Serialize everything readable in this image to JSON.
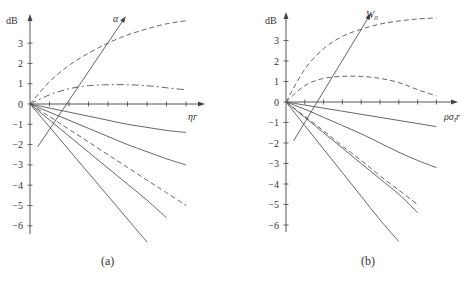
{
  "chart_data": [
    {
      "type": "line",
      "panel_label": "(a)",
      "ylabel": "dB",
      "xlabel": "ηr",
      "arrow_label": "α",
      "yticks": [
        3,
        2,
        1,
        0,
        -1,
        -2,
        -3,
        -4,
        -5,
        -6
      ],
      "ylim": [
        -7,
        4.3
      ],
      "grid": false,
      "x": [
        0,
        1,
        2,
        3,
        4,
        5,
        6,
        7,
        8
      ],
      "series": [
        {
          "name": "upper dashed",
          "style": "dashed",
          "values": [
            0,
            1.1,
            1.9,
            2.5,
            3.0,
            3.4,
            3.7,
            3.95,
            4.1
          ]
        },
        {
          "name": "dash-dot",
          "style": "dashdot",
          "values": [
            0,
            0.45,
            0.75,
            0.9,
            0.95,
            0.95,
            0.9,
            0.8,
            0.7
          ]
        },
        {
          "name": "solid 1",
          "style": "solid",
          "values": [
            0,
            -0.2,
            -0.4,
            -0.6,
            -0.8,
            -1.0,
            -1.15,
            -1.3,
            -1.4
          ]
        },
        {
          "name": "solid 2",
          "style": "solid",
          "values": [
            0,
            -0.4,
            -0.8,
            -1.2,
            -1.6,
            -2.0,
            -2.35,
            -2.7,
            -3.0
          ]
        },
        {
          "name": "lower dashed",
          "style": "dashed",
          "values": [
            0,
            -0.62,
            -1.25,
            -1.87,
            -2.5,
            -3.12,
            -3.75,
            -4.37,
            -5.0
          ]
        },
        {
          "name": "solid 3",
          "style": "solid",
          "values": [
            0,
            -0.79,
            -1.58,
            -2.37,
            -3.16,
            -3.95,
            -4.74,
            -5.6
          ]
        },
        {
          "name": "solid 4",
          "style": "solid",
          "values": [
            0,
            -1.13,
            -2.27,
            -3.4,
            -4.53,
            -5.67,
            -6.8
          ]
        }
      ],
      "arrow": {
        "from": [
          0.4,
          -2.1
        ],
        "to": [
          4.9,
          4.3
        ],
        "label": "α"
      }
    },
    {
      "type": "line",
      "panel_label": "(b)",
      "ylabel": "dB",
      "xlabel": "ρσIr",
      "arrow_label": "W0",
      "yticks": [
        3,
        2,
        1,
        0,
        -1,
        -2,
        -3,
        -4,
        -5,
        -6
      ],
      "ylim": [
        -7,
        4.3
      ],
      "grid": false,
      "x": [
        0,
        1,
        2,
        3,
        4,
        5,
        6,
        7,
        8
      ],
      "series": [
        {
          "name": "upper dashed",
          "style": "dashed",
          "values": [
            0,
            1.6,
            2.6,
            3.2,
            3.55,
            3.8,
            3.95,
            4.05,
            4.1
          ]
        },
        {
          "name": "middle dashed",
          "style": "dashed",
          "values": [
            0,
            0.8,
            1.15,
            1.25,
            1.25,
            1.15,
            0.95,
            0.6,
            0.3
          ]
        },
        {
          "name": "solid 1",
          "style": "solid",
          "values": [
            0,
            -0.15,
            -0.3,
            -0.45,
            -0.6,
            -0.75,
            -0.9,
            -1.05,
            -1.2
          ]
        },
        {
          "name": "solid 2",
          "style": "solid",
          "values": [
            0,
            -0.35,
            -0.75,
            -1.15,
            -1.55,
            -2.0,
            -2.45,
            -2.85,
            -3.2
          ]
        },
        {
          "name": "lower dashed",
          "style": "dashed",
          "values": [
            0,
            -0.7,
            -1.4,
            -2.15,
            -2.85,
            -3.6,
            -4.3,
            -5.0
          ]
        },
        {
          "name": "solid 3",
          "style": "solid",
          "values": [
            0,
            -0.75,
            -1.5,
            -2.25,
            -3.0,
            -3.75,
            -4.5,
            -5.4
          ]
        },
        {
          "name": "solid 4",
          "style": "solid",
          "values": [
            0,
            -1.15,
            -2.3,
            -3.45,
            -4.6,
            -5.75,
            -6.8
          ]
        }
      ],
      "arrow": {
        "from": [
          0.4,
          -1.9
        ],
        "to": [
          4.5,
          4.3
        ],
        "label": "W0"
      }
    }
  ],
  "panels": {
    "a": {
      "caption": "(a)",
      "ylabel": "dB",
      "xlabel": "ηr",
      "param": "α"
    },
    "b": {
      "caption": "(b)",
      "ylabel": "dB",
      "xlabel": "ρσ",
      "xlabel_sub": "I",
      "xlabel_tail": "r",
      "param": "W",
      "param_sub": "0"
    }
  }
}
